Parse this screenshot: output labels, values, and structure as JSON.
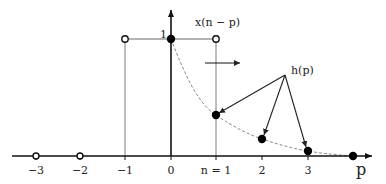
{
  "diagram": {
    "labels": {
      "signal": "x(n − p)",
      "impulse_response": "h(p)",
      "amplitude_one": "1",
      "axis_variable": "p"
    },
    "ticks": [
      {
        "value": -3,
        "label": "−3"
      },
      {
        "value": -2,
        "label": "−2"
      },
      {
        "value": -1,
        "label": "−1"
      },
      {
        "value": 0,
        "label": "0"
      },
      {
        "value": 1,
        "label": "n = 1"
      },
      {
        "value": 2,
        "label": "2"
      },
      {
        "value": 3,
        "label": "3"
      }
    ],
    "x_n_minus_p": {
      "description": "rectangular window of height 1 spanning p from -1 to n=1",
      "height": 1,
      "open_endpoints": [
        -1,
        1
      ],
      "filled_point": 0,
      "shift_direction": "right"
    },
    "h_p_samples": [
      {
        "p": 0,
        "value": 1.0
      },
      {
        "p": 1,
        "value": 0.35
      },
      {
        "p": 2,
        "value": 0.15
      },
      {
        "p": 3,
        "value": 0.04
      },
      {
        "p": 4,
        "value": 0.0
      }
    ],
    "zero_samples_open": [
      -3,
      -2
    ],
    "colors": {
      "axis": "#111111",
      "window": "#999999",
      "curve": "#888888",
      "point": "#000000"
    }
  }
}
